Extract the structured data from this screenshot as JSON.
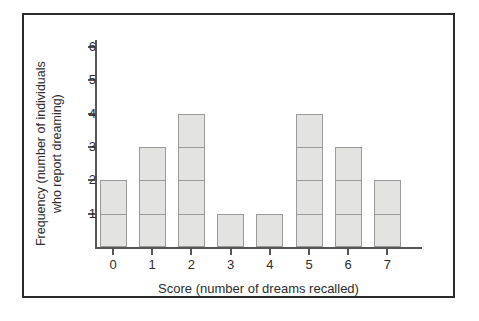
{
  "chart_data": {
    "type": "bar",
    "title": "",
    "subtitle": "",
    "xlabel": "Score (number of dreams recalled)",
    "ylabel_line1": "Frequency (number of individuals",
    "ylabel_line2": "who report dreaming)",
    "ylabel": "Frequency (number of individuals who report dreaming)",
    "categories": [
      "0",
      "1",
      "2",
      "3",
      "4",
      "5",
      "6",
      "7"
    ],
    "values": [
      2,
      3,
      4,
      1,
      1,
      4,
      3,
      2
    ],
    "x_tick_labels": [
      "0",
      "1",
      "2",
      "3",
      "4",
      "5",
      "6",
      "7"
    ],
    "y_tick_labels": [
      "1",
      "2",
      "3",
      "4",
      "5",
      "6"
    ],
    "y_tick_values": [
      1,
      2,
      3,
      4,
      5,
      6
    ],
    "xlim": [
      -0.5,
      7.5
    ],
    "ylim": [
      0,
      6.3
    ],
    "grid": false,
    "legend": null,
    "annotations": [],
    "segmented_bars": true
  },
  "style": {
    "bar_fill": "#e3e3e1",
    "bar_stroke": "#9a9a9a",
    "axis_color": "#555555",
    "text_color": "#2d2d2d",
    "frame_color": "#2b2b2b",
    "background": "#ffffff"
  }
}
